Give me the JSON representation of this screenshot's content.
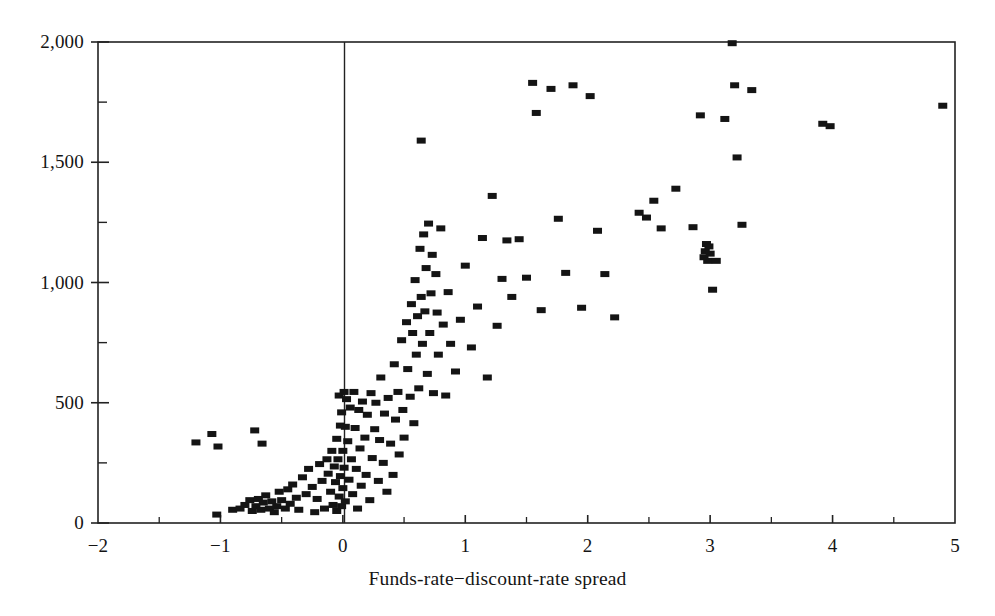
{
  "chart_data": {
    "type": "scatter",
    "title": "",
    "subtitle": "",
    "xlabel": "Funds-rate−discount-rate spread",
    "ylabel": "",
    "xlim": [
      -2,
      5
    ],
    "ylim": [
      0,
      2000
    ],
    "grid": false,
    "legend": null,
    "x_ticks_major": [
      -2,
      -1,
      0,
      1,
      2,
      3,
      4,
      5
    ],
    "x_tick_labels": [
      "-2",
      "-1",
      "0",
      "1",
      "2",
      "3",
      "4",
      "5"
    ],
    "x_ticks_minor": [
      -1.5,
      -0.5,
      0.5,
      1.5,
      2.5,
      3.5,
      4.5
    ],
    "y_ticks_major": [
      0,
      500,
      1000,
      1500,
      2000
    ],
    "y_tick_labels": [
      "0",
      "500",
      "1,000",
      "1,500",
      "2,000"
    ],
    "y_ticks_minor": [
      250,
      750,
      1250,
      1750
    ],
    "marker": "filled-square",
    "marker_color": "#141414",
    "marker_width_px": 9,
    "marker_height_px": 6,
    "zero_reference_line_x": 0,
    "frame": "box",
    "points": [
      [
        -1.2,
        335
      ],
      [
        -1.07,
        370
      ],
      [
        -1.02,
        318
      ],
      [
        -0.72,
        385
      ],
      [
        -0.66,
        330
      ],
      [
        -1.03,
        35
      ],
      [
        -0.9,
        55
      ],
      [
        -0.84,
        60
      ],
      [
        -0.8,
        75
      ],
      [
        -0.76,
        95
      ],
      [
        -0.74,
        50
      ],
      [
        -0.71,
        70
      ],
      [
        -0.69,
        100
      ],
      [
        -0.67,
        55
      ],
      [
        -0.65,
        85
      ],
      [
        -0.63,
        115
      ],
      [
        -0.6,
        60
      ],
      [
        -0.58,
        90
      ],
      [
        -0.56,
        45
      ],
      [
        -0.54,
        70
      ],
      [
        -0.52,
        130
      ],
      [
        -0.5,
        95
      ],
      [
        -0.47,
        60
      ],
      [
        -0.45,
        140
      ],
      [
        -0.43,
        80
      ],
      [
        -0.41,
        160
      ],
      [
        -0.38,
        105
      ],
      [
        -0.36,
        55
      ],
      [
        -0.33,
        190
      ],
      [
        -0.3,
        120
      ],
      [
        -0.28,
        225
      ],
      [
        -0.25,
        150
      ],
      [
        -0.23,
        45
      ],
      [
        -0.21,
        100
      ],
      [
        -0.19,
        245
      ],
      [
        -0.17,
        175
      ],
      [
        -0.15,
        60
      ],
      [
        -0.13,
        265
      ],
      [
        -0.12,
        205
      ],
      [
        -0.1,
        130
      ],
      [
        -0.09,
        300
      ],
      [
        -0.08,
        75
      ],
      [
        -0.07,
        235
      ],
      [
        -0.06,
        170
      ],
      [
        -0.05,
        50
      ],
      [
        -0.05,
        350
      ],
      [
        -0.04,
        265
      ],
      [
        -0.03,
        110
      ],
      [
        -0.03,
        530
      ],
      [
        -0.02,
        405
      ],
      [
        -0.02,
        195
      ],
      [
        -0.01,
        70
      ],
      [
        -0.01,
        460
      ],
      [
        0.0,
        300
      ],
      [
        0.0,
        145
      ],
      [
        0.01,
        545
      ],
      [
        0.01,
        230
      ],
      [
        0.02,
        400
      ],
      [
        0.02,
        90
      ],
      [
        0.03,
        515
      ],
      [
        0.04,
        340
      ],
      [
        0.05,
        180
      ],
      [
        0.06,
        480
      ],
      [
        0.07,
        265
      ],
      [
        0.08,
        120
      ],
      [
        0.09,
        545
      ],
      [
        0.1,
        395
      ],
      [
        0.11,
        225
      ],
      [
        0.12,
        60
      ],
      [
        0.13,
        470
      ],
      [
        0.14,
        310
      ],
      [
        0.15,
        155
      ],
      [
        0.16,
        505
      ],
      [
        0.18,
        355
      ],
      [
        0.19,
        200
      ],
      [
        0.2,
        450
      ],
      [
        0.22,
        95
      ],
      [
        0.23,
        540
      ],
      [
        0.24,
        270
      ],
      [
        0.26,
        390
      ],
      [
        0.27,
        500
      ],
      [
        0.29,
        175
      ],
      [
        0.3,
        345
      ],
      [
        0.31,
        605
      ],
      [
        0.33,
        250
      ],
      [
        0.34,
        455
      ],
      [
        0.36,
        130
      ],
      [
        0.37,
        520
      ],
      [
        0.39,
        330
      ],
      [
        0.41,
        200
      ],
      [
        0.42,
        660
      ],
      [
        0.43,
        430
      ],
      [
        0.45,
        545
      ],
      [
        0.46,
        285
      ],
      [
        0.48,
        760
      ],
      [
        0.49,
        470
      ],
      [
        0.5,
        355
      ],
      [
        0.52,
        835
      ],
      [
        0.53,
        640
      ],
      [
        0.55,
        525
      ],
      [
        0.56,
        910
      ],
      [
        0.57,
        790
      ],
      [
        0.58,
        415
      ],
      [
        0.59,
        1010
      ],
      [
        0.6,
        700
      ],
      [
        0.61,
        860
      ],
      [
        0.62,
        560
      ],
      [
        0.63,
        1140
      ],
      [
        0.64,
        940
      ],
      [
        0.65,
        745
      ],
      [
        0.66,
        1200
      ],
      [
        0.67,
        880
      ],
      [
        0.68,
        1060
      ],
      [
        0.69,
        620
      ],
      [
        0.7,
        1245
      ],
      [
        0.71,
        790
      ],
      [
        0.72,
        955
      ],
      [
        0.73,
        1115
      ],
      [
        0.74,
        540
      ],
      [
        0.76,
        1035
      ],
      [
        0.77,
        875
      ],
      [
        0.78,
        700
      ],
      [
        0.8,
        1225
      ],
      [
        0.82,
        825
      ],
      [
        0.84,
        530
      ],
      [
        0.86,
        960
      ],
      [
        0.88,
        745
      ],
      [
        0.64,
        1590
      ],
      [
        0.92,
        630
      ],
      [
        0.96,
        845
      ],
      [
        1.0,
        1070
      ],
      [
        1.05,
        730
      ],
      [
        1.1,
        900
      ],
      [
        1.14,
        1185
      ],
      [
        1.18,
        605
      ],
      [
        1.22,
        1360
      ],
      [
        1.26,
        820
      ],
      [
        1.3,
        1015
      ],
      [
        1.34,
        1175
      ],
      [
        1.38,
        940
      ],
      [
        1.44,
        1180
      ],
      [
        1.5,
        1020
      ],
      [
        1.55,
        1830
      ],
      [
        1.58,
        1705
      ],
      [
        1.62,
        885
      ],
      [
        1.7,
        1805
      ],
      [
        1.76,
        1265
      ],
      [
        1.82,
        1040
      ],
      [
        1.88,
        1820
      ],
      [
        1.95,
        895
      ],
      [
        2.02,
        1775
      ],
      [
        2.08,
        1215
      ],
      [
        2.14,
        1035
      ],
      [
        2.22,
        855
      ],
      [
        2.42,
        1290
      ],
      [
        2.48,
        1270
      ],
      [
        2.54,
        1340
      ],
      [
        2.6,
        1225
      ],
      [
        2.72,
        1390
      ],
      [
        2.86,
        1230
      ],
      [
        2.92,
        1695
      ],
      [
        2.95,
        1105
      ],
      [
        2.96,
        1130
      ],
      [
        2.97,
        1160
      ],
      [
        2.98,
        1090
      ],
      [
        2.99,
        1150
      ],
      [
        3.0,
        1120
      ],
      [
        3.02,
        970
      ],
      [
        3.05,
        1090
      ],
      [
        3.12,
        1680
      ],
      [
        3.18,
        1995
      ],
      [
        3.2,
        1820
      ],
      [
        3.22,
        1520
      ],
      [
        3.26,
        1240
      ],
      [
        3.34,
        1800
      ],
      [
        3.92,
        1660
      ],
      [
        3.98,
        1650
      ],
      [
        4.9,
        1735
      ]
    ]
  }
}
